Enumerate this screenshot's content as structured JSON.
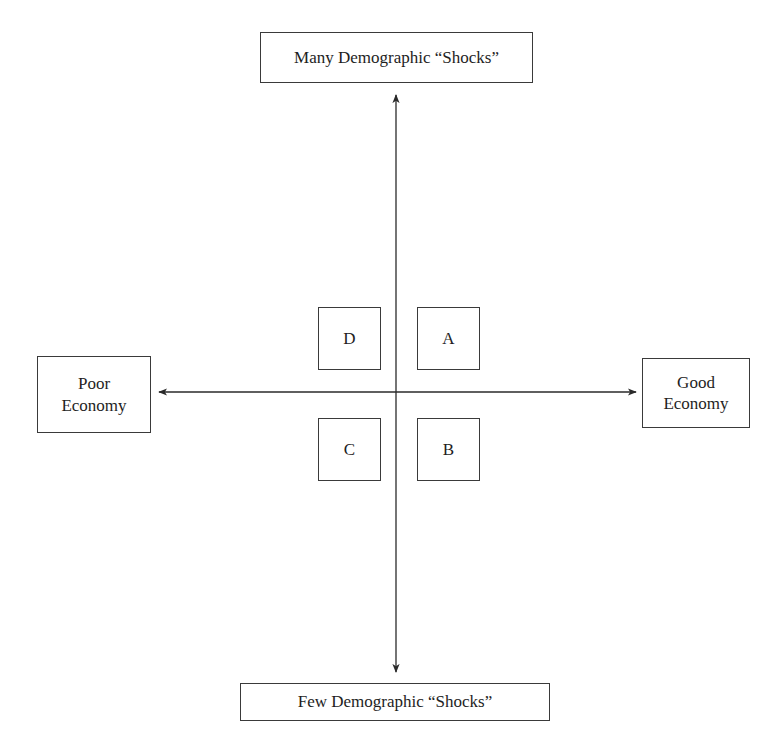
{
  "diagram": {
    "type": "quadrant-matrix",
    "axes": {
      "vertical": {
        "top_label": "Many Demographic “Shocks”",
        "bottom_label": "Few Demographic “Shocks”"
      },
      "horizontal": {
        "left_label_line1": "Poor",
        "left_label_line2": "Economy",
        "right_label_line1": "Good",
        "right_label_line2": "Economy"
      }
    },
    "quadrants": {
      "top_left": "D",
      "top_right": "A",
      "bottom_left": "C",
      "bottom_right": "B"
    },
    "colors": {
      "line": "#2a2a2a",
      "text": "#1e1e1e",
      "background": "#ffffff"
    }
  }
}
